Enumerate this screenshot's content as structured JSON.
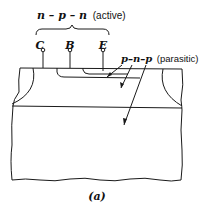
{
  "diagram": {
    "caption": "(a)",
    "active_label": {
      "seq": "n – p – n",
      "note": "(active)"
    },
    "parasitic_label": {
      "seq": "p–n–p",
      "note": "(parasitic)"
    },
    "terminals": [
      {
        "id": "C",
        "label": "C"
      },
      {
        "id": "B",
        "label": "B"
      },
      {
        "id": "E",
        "label": "E"
      }
    ],
    "colors": {
      "line": "#1a1a1a",
      "background": "#ffffff"
    }
  }
}
